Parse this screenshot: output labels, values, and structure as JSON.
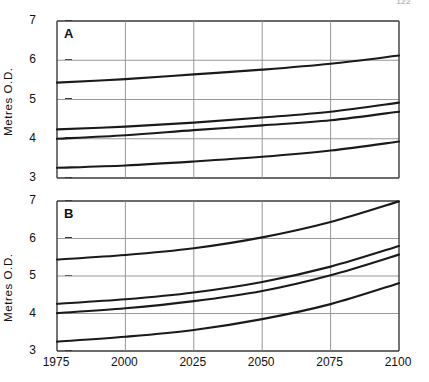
{
  "page": {
    "page_number": "122",
    "background": "#ffffff",
    "width": 429,
    "height": 382
  },
  "style": {
    "curve_color": "#1a1a1a",
    "grid_color": "#8c8c8c",
    "axis_color": "#3a3a3a",
    "text_color": "#111111"
  },
  "chart_data": [
    {
      "type": "line",
      "panel_label": "A",
      "title": "",
      "xlabel": "",
      "ylabel": "Metres O.D.",
      "xlim": [
        1975,
        2100
      ],
      "ylim": [
        3,
        7
      ],
      "xticks": [
        1975,
        2000,
        2025,
        2050,
        2075,
        2100
      ],
      "xticklabels": [
        "1975",
        "2000",
        "2025",
        "2050",
        "2075",
        "2100"
      ],
      "yticks": [
        3,
        4,
        5,
        6,
        7
      ],
      "yticklabels": [
        "3",
        "4",
        "5",
        "6",
        "7"
      ],
      "grid": true,
      "legend": "none",
      "x": [
        1975,
        2000,
        2025,
        2050,
        2075,
        2100
      ],
      "series": [
        {
          "name": "curve-1",
          "values": [
            5.43,
            5.52,
            5.64,
            5.76,
            5.91,
            6.12
          ]
        },
        {
          "name": "curve-2",
          "values": [
            4.24,
            4.31,
            4.41,
            4.54,
            4.69,
            4.92
          ]
        },
        {
          "name": "curve-3",
          "values": [
            4.0,
            4.09,
            4.22,
            4.34,
            4.47,
            4.69
          ]
        },
        {
          "name": "curve-4",
          "values": [
            3.26,
            3.32,
            3.42,
            3.54,
            3.7,
            3.93
          ]
        }
      ]
    },
    {
      "type": "line",
      "panel_label": "B",
      "title": "",
      "xlabel": "",
      "ylabel": "Metres O.D.",
      "xlim": [
        1975,
        2100
      ],
      "ylim": [
        3,
        7
      ],
      "xticks": [
        1975,
        2000,
        2025,
        2050,
        2075,
        2100
      ],
      "xticklabels": [
        "1975",
        "2000",
        "2025",
        "2050",
        "2075",
        "2100"
      ],
      "yticks": [
        3,
        4,
        5,
        6,
        7
      ],
      "yticklabels": [
        "3",
        "4",
        "5",
        "6",
        "7"
      ],
      "grid": true,
      "legend": "none",
      "x": [
        1975,
        2000,
        2025,
        2050,
        2075,
        2100
      ],
      "series": [
        {
          "name": "curve-1",
          "values": [
            5.44,
            5.56,
            5.74,
            6.03,
            6.44,
            6.99
          ]
        },
        {
          "name": "curve-2",
          "values": [
            4.26,
            4.38,
            4.56,
            4.84,
            5.25,
            5.8
          ]
        },
        {
          "name": "curve-3",
          "values": [
            4.01,
            4.14,
            4.33,
            4.6,
            5.02,
            5.57
          ]
        },
        {
          "name": "curve-4",
          "values": [
            3.25,
            3.38,
            3.56,
            3.85,
            4.25,
            4.81
          ]
        }
      ]
    }
  ]
}
